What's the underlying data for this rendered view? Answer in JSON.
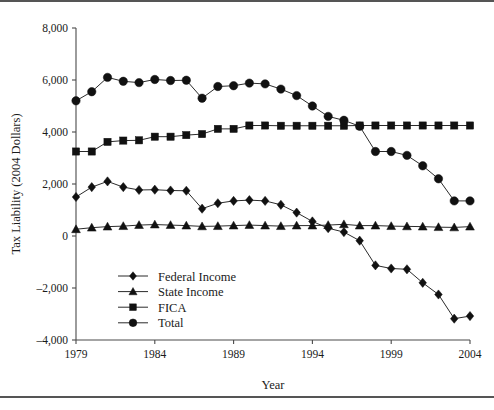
{
  "figure": {
    "has_top_rule": true,
    "has_bottom_rule": true
  },
  "chart_data": {
    "type": "line",
    "title": "",
    "xlabel": "Year",
    "ylabel": "Tax Liability (2004 Dollars)",
    "xlim": [
      1979,
      2004
    ],
    "ylim": [
      -4000,
      8000
    ],
    "grid": false,
    "legend_position": "inside-lower-left",
    "x": [
      1979,
      1980,
      1981,
      1982,
      1983,
      1984,
      1985,
      1986,
      1987,
      1988,
      1989,
      1990,
      1991,
      1992,
      1993,
      1994,
      1995,
      1996,
      1997,
      1998,
      1999,
      2000,
      2001,
      2002,
      2003,
      2004
    ],
    "xticks": [
      1979,
      1984,
      1989,
      1994,
      1999,
      2004
    ],
    "xticklabels": [
      "1979",
      "1984",
      "1989",
      "1994",
      "1999",
      "2004"
    ],
    "yticks": [
      -4000,
      -2000,
      0,
      2000,
      4000,
      6000,
      8000
    ],
    "yticklabels": [
      "-4,000",
      "-2,000",
      "0",
      "2,000",
      "4,000",
      "6,000",
      "8,000"
    ],
    "series": [
      {
        "name": "Federal Income",
        "marker": "diamond",
        "values": [
          1500,
          1880,
          2100,
          1880,
          1770,
          1780,
          1750,
          1740,
          1050,
          1260,
          1350,
          1380,
          1350,
          1200,
          900,
          560,
          300,
          150,
          -180,
          -1130,
          -1250,
          -1280,
          -1800,
          -2250,
          -3180,
          -3080
        ]
      },
      {
        "name": "State Income",
        "marker": "triangle",
        "values": [
          260,
          320,
          360,
          380,
          420,
          440,
          420,
          400,
          370,
          380,
          400,
          420,
          400,
          380,
          400,
          400,
          420,
          450,
          400,
          400,
          380,
          370,
          360,
          340,
          330,
          360
        ]
      },
      {
        "name": "FICA",
        "marker": "square",
        "values": [
          3250,
          3250,
          3620,
          3670,
          3680,
          3820,
          3820,
          3880,
          3920,
          4120,
          4120,
          4250,
          4250,
          4240,
          4240,
          4240,
          4240,
          4240,
          4250,
          4250,
          4250,
          4250,
          4250,
          4250,
          4250,
          4250
        ]
      },
      {
        "name": "Total",
        "marker": "circle",
        "values": [
          5200,
          5550,
          6100,
          5950,
          5900,
          6020,
          5980,
          5990,
          5300,
          5750,
          5780,
          5880,
          5850,
          5650,
          5400,
          5000,
          4600,
          4450,
          4220,
          3250,
          3250,
          3100,
          2700,
          2200,
          1350,
          1350
        ]
      }
    ]
  },
  "legend": {
    "items": [
      {
        "label": "Federal Income",
        "marker": "diamond"
      },
      {
        "label": "State Income",
        "marker": "triangle"
      },
      {
        "label": "FICA",
        "marker": "square"
      },
      {
        "label": "Total",
        "marker": "circle"
      }
    ]
  }
}
